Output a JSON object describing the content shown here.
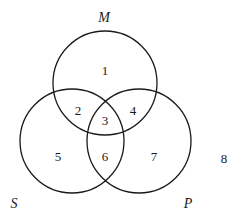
{
  "diagram": {
    "type": "venn",
    "sets": [
      {
        "id": "M",
        "label": "M",
        "cx": 105,
        "cy": 83,
        "r": 52,
        "label_x": 104,
        "label_y": 17
      },
      {
        "id": "S",
        "label": "S",
        "cx": 72,
        "cy": 141,
        "r": 52,
        "label_x": 14,
        "label_y": 203
      },
      {
        "id": "P",
        "label": "P",
        "cx": 139,
        "cy": 141,
        "r": 52,
        "label_x": 188,
        "label_y": 203
      }
    ],
    "regions": [
      {
        "label": "1",
        "x": 105,
        "y": 70
      },
      {
        "label": "2",
        "x": 78,
        "y": 110
      },
      {
        "label": "3",
        "x": 105,
        "y": 120
      },
      {
        "label": "4",
        "x": 133,
        "y": 110
      },
      {
        "label": "5",
        "x": 58,
        "y": 156
      },
      {
        "label": "6",
        "x": 105,
        "y": 156
      },
      {
        "label": "7",
        "x": 154,
        "y": 156
      },
      {
        "label": "8",
        "x": 224,
        "y": 158
      }
    ],
    "stroke_color": "#1a1a1a",
    "background": "#ffffff"
  }
}
